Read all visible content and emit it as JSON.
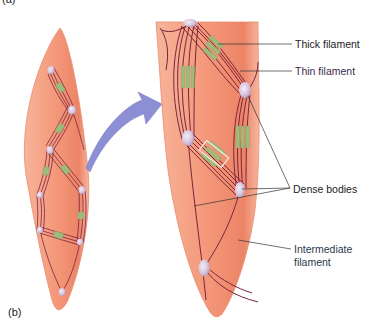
{
  "figure": {
    "panel_a_label": "(a)",
    "panel_b_label": "(b)"
  },
  "labels": {
    "thick_filament": "Thick filament",
    "thin_filament": "Thin filament",
    "dense_bodies": "Dense bodies",
    "intermediate_filament_line1": "Intermediate",
    "intermediate_filament_line2": "filament"
  },
  "colors": {
    "cell_fill": "#f49a7a",
    "cell_edge": "#e07a5c",
    "thin_filament": "#7a2440",
    "thick_filament": "#9dbb7a",
    "dense_body": "#d8c6dc",
    "arrow": "#8c8fd4",
    "leader_line": "#333333",
    "label_text": "#222222"
  }
}
